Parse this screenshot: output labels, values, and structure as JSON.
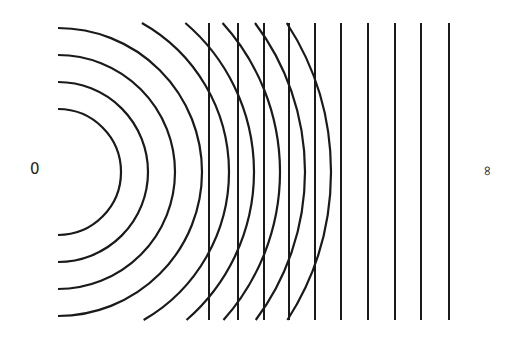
{
  "diagram": {
    "stroke_color": "#1a1a1a",
    "background": "#ffffff",
    "labels": {
      "left": "0",
      "right": "∞"
    },
    "source_center": {
      "x": 58,
      "y": 172
    },
    "arcs": {
      "clip_top": 23,
      "clip_bottom": 320,
      "radii": [
        63,
        90,
        117,
        144,
        171,
        196,
        222,
        247,
        273
      ]
    },
    "plane_waves": {
      "top": 23,
      "bottom": 320,
      "x_positions": [
        209,
        238,
        264,
        289,
        315,
        341,
        368,
        395,
        421,
        449
      ]
    }
  }
}
